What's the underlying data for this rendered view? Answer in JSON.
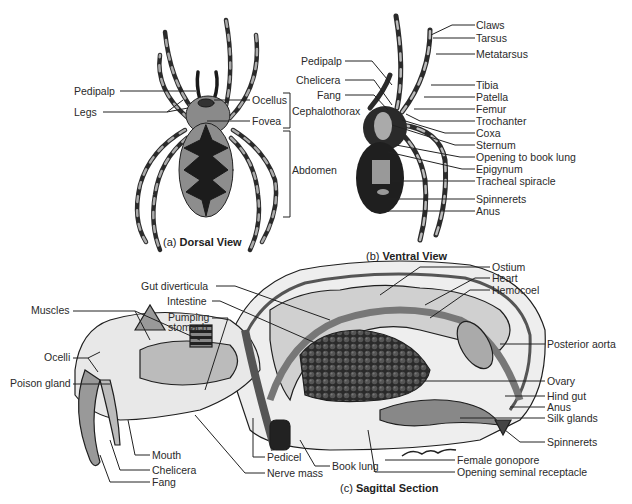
{
  "figure": {
    "panels": [
      {
        "id": "a",
        "prefix": "(a)",
        "title": "Dorsal View"
      },
      {
        "id": "b",
        "prefix": "(b)",
        "title": "Ventral View"
      },
      {
        "id": "c",
        "prefix": "(c)",
        "title": "Sagittal Section"
      }
    ],
    "dorsal": {
      "labels": [
        "Pedipalp",
        "Legs",
        "Ocellus",
        "Fovea"
      ],
      "brackets": [
        "Cephalothorax",
        "Abdomen"
      ]
    },
    "ventral": {
      "left_labels": [
        "Pedipalp",
        "Chelicera",
        "Fang"
      ],
      "right_labels": [
        "Claws",
        "Tarsus",
        "Metatarsus",
        "Tibia",
        "Patella",
        "Femur",
        "Trochanter",
        "Coxa",
        "Sternum",
        "Opening to book lung",
        "Epigynum",
        "Tracheal spiracle",
        "Spinnerets",
        "Anus"
      ]
    },
    "sagittal": {
      "left_labels": [
        "Muscles",
        "Ocelli",
        "Poison gland"
      ],
      "top_labels": [
        "Gut diverticula",
        "Intestine",
        "Pumping",
        "stomach"
      ],
      "bottom_labels": [
        "Mouth",
        "Chelicera",
        "Fang",
        "Pedicel",
        "Nerve mass",
        "Book lung",
        "Female gonopore",
        "Opening seminal receptacle"
      ],
      "right_labels": [
        "Ostium",
        "Heart",
        "Hemocoel",
        "Posterior aorta",
        "Ovary",
        "Hind gut",
        "Anus",
        "Silk glands",
        "Spinnerets"
      ],
      "signature": "Bischoff"
    }
  }
}
